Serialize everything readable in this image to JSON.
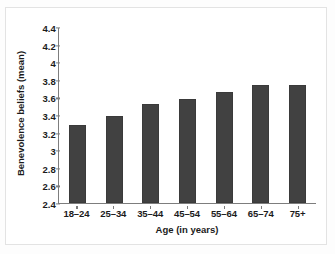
{
  "chart_data": {
    "type": "bar",
    "title": "",
    "xlabel": "Age (in years)",
    "ylabel": "Benevolence beliefs (mean)",
    "categories": [
      "18–24",
      "25–34",
      "35–44",
      "45–54",
      "55–64",
      "65–74",
      "75+"
    ],
    "values": [
      3.29,
      3.39,
      3.52,
      3.58,
      3.66,
      3.74,
      3.74
    ],
    "ylim": [
      2.4,
      4.4
    ],
    "yticks": [
      2.4,
      2.6,
      2.8,
      3,
      3.2,
      3.4,
      3.6,
      3.8,
      4,
      4.2,
      4.4
    ],
    "ytick_labels": [
      "2.4",
      "2.6",
      "2.8",
      "3",
      "3.2",
      "3.4",
      "3.6",
      "3.8",
      "4",
      "4.2",
      "4.4"
    ],
    "grid": false,
    "legend": null,
    "bar_color": "#414141",
    "axis_color": "#7d7d7d",
    "text_color": "#1b1b1b",
    "frame_color": "#e3e3e3",
    "background": "#ffffff"
  }
}
